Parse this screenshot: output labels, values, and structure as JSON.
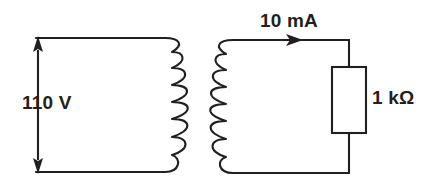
{
  "diagram": {
    "background_color": "#ffffff",
    "line_color": "#231f20",
    "primary": {
      "source_label": "110 V",
      "source_arrow": "double-headed-vertical",
      "coil_turns": 6,
      "coil_bulge": "right"
    },
    "secondary": {
      "current_label": "10 mA",
      "current_arrow": "right",
      "resistor_label": "1 kΩ",
      "coil_turns": 6,
      "coil_bulge": "left"
    }
  }
}
